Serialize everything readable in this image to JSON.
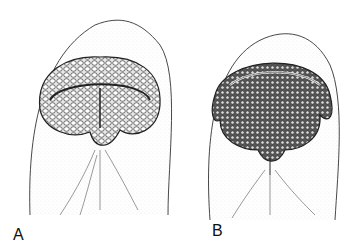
{
  "figure": {
    "panels": [
      {
        "label": "A",
        "description": "Ventral view of head with papillose oral disc (lips), variant A"
      },
      {
        "label": "B",
        "description": "Ventral view of head with papillose oral disc (lips), variant B"
      }
    ],
    "colors": {
      "ink": "#222222",
      "stipple": "#9a9a9a",
      "background": "#ffffff"
    }
  }
}
